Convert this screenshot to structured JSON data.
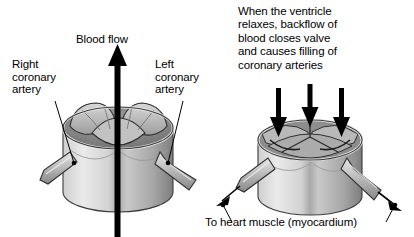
{
  "diagram": {
    "title_labels": {
      "blood_flow": "Blood flow",
      "right_coronary_artery": "Right\ncoronary\nartery",
      "left_coronary_artery": "Left\ncoronary\nartery",
      "diastole_caption": "When the ventricle\nrelaxes, backflow of\nblood closes valve\nand causes filling of\ncoronary arteries",
      "to_heart_muscle": "To heart muscle (myocardium)"
    },
    "panels": [
      {
        "id": "systole",
        "name": "valve-open-systole",
        "description": "Aortic root cylinder with valve cusps open, blood flowing upward",
        "flow_direction": "up",
        "arrow_count": 1
      },
      {
        "id": "diastole",
        "name": "valve-closed-diastole",
        "description": "Aortic root cylinder with valve cusps closed, backflow filling coronary arteries",
        "flow_direction": "down",
        "arrow_count": 3
      }
    ],
    "colors": {
      "ink": "#000000",
      "background": "#ffffff",
      "tissue_light": "#e3e3e3",
      "tissue_mid": "#b4b4b4",
      "tissue_dark": "#8a8a8a",
      "tissue_shadow": "#6d6d6d",
      "outline": "#2b2b2b"
    }
  }
}
